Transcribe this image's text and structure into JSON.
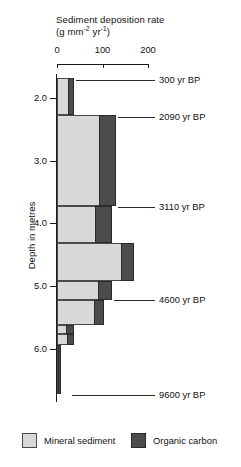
{
  "chart_data": {
    "type": "bar",
    "orientation": "horizontal-depth-profile",
    "title": "Sediment deposition rate",
    "title_line1": "Sediment deposition rate",
    "title_units_prefix": "(g mm",
    "title_units_sup1": "-2",
    "title_units_mid": " yr",
    "title_units_sup2": "-1",
    "title_units_suffix": ")",
    "xlabel": "Sediment deposition rate (g mm-2 yr-1)",
    "ylabel": "Depth in metres",
    "xlim": [
      0,
      230
    ],
    "ylim": [
      1.62,
      6.85
    ],
    "x_ticks": [
      0,
      100,
      200
    ],
    "x_tick_labels": [
      "0",
      "100",
      "200"
    ],
    "y_ticks": [
      2.0,
      3.0,
      4.0,
      5.0,
      6.0
    ],
    "y_tick_labels": [
      "2.0",
      "3.0",
      "4.0",
      "5.0",
      "6.0"
    ],
    "grid": false,
    "legend_position": "bottom",
    "series": [
      {
        "name": "Mineral sediment",
        "color": "#d8d8d8"
      },
      {
        "name": "Organic carbon",
        "color": "#4c4c4c"
      }
    ],
    "segments": [
      {
        "depth_top": 1.68,
        "depth_bottom": 2.28,
        "mineral": 26,
        "organic": 14
      },
      {
        "depth_top": 2.28,
        "depth_bottom": 3.72,
        "mineral": 94,
        "organic": 38
      },
      {
        "depth_top": 3.72,
        "depth_bottom": 4.32,
        "mineral": 86,
        "organic": 38
      },
      {
        "depth_top": 4.32,
        "depth_bottom": 4.92,
        "mineral": 142,
        "organic": 30
      },
      {
        "depth_top": 4.92,
        "depth_bottom": 5.22,
        "mineral": 92,
        "organic": 32
      },
      {
        "depth_top": 5.22,
        "depth_bottom": 5.62,
        "mineral": 84,
        "organic": 22
      },
      {
        "depth_top": 5.62,
        "depth_bottom": 5.76,
        "mineral": 22,
        "organic": 18
      },
      {
        "depth_top": 5.76,
        "depth_bottom": 5.94,
        "mineral": 24,
        "organic": 16
      },
      {
        "depth_top": 5.94,
        "depth_bottom": 6.72,
        "mineral": 4,
        "organic": 8
      }
    ],
    "annotations": [
      {
        "label": "300 yr BP",
        "depth": 1.72
      },
      {
        "label": "2090 yr BP",
        "depth": 2.3
      },
      {
        "label": "3110 yr BP",
        "depth": 3.74
      },
      {
        "label": "4600 yr BP",
        "depth": 5.22
      },
      {
        "label": "9600 yr BP",
        "depth": 6.74
      }
    ]
  },
  "legend": {
    "mineral_label": "Mineral sediment",
    "organic_label": "Organic carbon"
  }
}
